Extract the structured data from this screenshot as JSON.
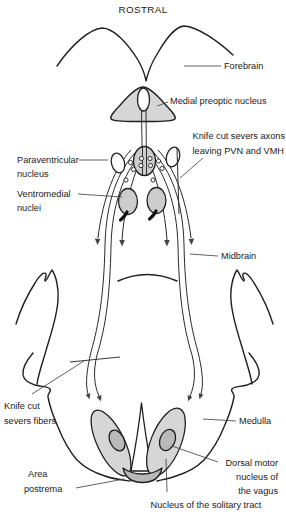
{
  "title": "ROSTRAL",
  "colors": {
    "ink": "#1f1f1f",
    "shape_fill": "#d6d6d6",
    "nucleus_fill": "#cccccc",
    "inner_fill": "#b9b9b9",
    "white_fill": "#ffffff",
    "background": "#ffffff"
  },
  "labels": {
    "forebrain": "Forebrain",
    "medial_preoptic_nucleus": "Medial preoptic nucleus",
    "knife_cut_axons_line1": "Knife cut severs axons",
    "knife_cut_axons_line2": "leaving PVN and VMH",
    "paraventricular_line1": "Paraventricular",
    "paraventricular_line2": "nucleus",
    "ventromedial_line1": "Ventromedial",
    "ventromedial_line2": "nuclei",
    "midbrain": "Midbrain",
    "knife_cut_fibers_line1": "Knife cut",
    "knife_cut_fibers_line2": "severs fibers",
    "medulla": "Medulla",
    "area_postrema_line1": "Area",
    "area_postrema_line2": "postrema",
    "dorsal_motor_line1": "Dorsal motor",
    "dorsal_motor_line2": "nucleus of",
    "dorsal_motor_line3": "the vagus",
    "nucleus_solitary_tract": "Nucleus of the solitary tract"
  }
}
